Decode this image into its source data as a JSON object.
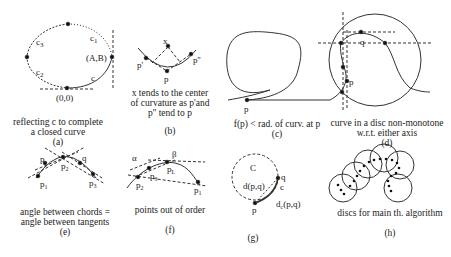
{
  "panels": [
    {
      "id": "a",
      "letter": "(a)",
      "caption_lines": [
        "reflecting c to complete",
        "a closed curve"
      ],
      "labels": {
        "c1": "c",
        "c1_sub": "1",
        "c2": "c",
        "c2_sub": "2",
        "c3": "c",
        "c3_sub": "3",
        "c": "c",
        "AB": "(A,B)",
        "origin": "(0,0)"
      }
    },
    {
      "id": "b",
      "letter": "(b)",
      "caption_lines": [
        "x tends to the center",
        "of curvature as p'and",
        "p'' tend to p"
      ],
      "labels": {
        "x": "x",
        "p": "p",
        "p1": "p'",
        "p2": "p''"
      }
    },
    {
      "id": "c",
      "letter": "(c)",
      "caption_lines": [
        "f(p) < rad. of curv. at p"
      ],
      "labels": {
        "p": "p"
      }
    },
    {
      "id": "d",
      "letter": "(d)",
      "caption_lines": [
        "curve in a disc non-monotone",
        "w.r.t. either axis"
      ],
      "labels": {
        "q": "q",
        "p": "p"
      }
    },
    {
      "id": "e",
      "letter": "(e)",
      "caption_lines": [
        "angle between chords =",
        "angle between tangents"
      ],
      "labels": {
        "p": "p",
        "q": "q",
        "p1": "p",
        "p1_sub": "1",
        "p2": "p",
        "p2_sub": "2",
        "p3": "p",
        "p3_sub": "3",
        "alpha": "α",
        "beta": "β"
      }
    },
    {
      "id": "f",
      "letter": "(f)",
      "caption_lines": [
        "points out of order"
      ],
      "labels": {
        "alpha": "α",
        "beta": "β",
        "p1": "p",
        "p1_sub": "1",
        "p2": "p",
        "p2_sub": "2",
        "p3": "p",
        "p3_sub": "3",
        "pL": "p",
        "pL_sub": "L"
      }
    },
    {
      "id": "g",
      "letter": "(g)",
      "caption_lines": [
        ""
      ],
      "labels": {
        "C": "C",
        "dpq": "d(p,q)",
        "dcpq": "d",
        "dcpq_sub": "c",
        "dcpq_rest": "(p,q)",
        "p": "p",
        "q": "q",
        "c": "c"
      }
    },
    {
      "id": "h",
      "letter": "(h)",
      "caption_lines": [
        "discs for main th. algorithm"
      ],
      "labels": {}
    }
  ]
}
